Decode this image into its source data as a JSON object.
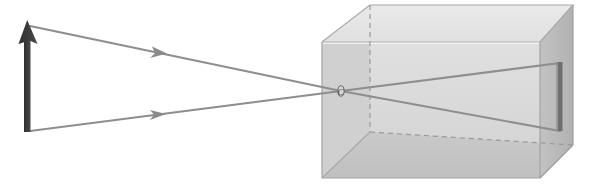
{
  "figure": {
    "width": 594,
    "height": 185,
    "background_color": "#ffffff"
  },
  "labels": {
    "pinhole": "C"
  },
  "colors": {
    "object_arrow": "#3b3b3b",
    "image_arrow": "#6f6f6f",
    "ray": "#8e8e8e",
    "box_front_face": "#d9d9d9",
    "box_top_face": "#e6e6e6",
    "box_right_face": "#b9b9b9",
    "box_bottom_inner_face": "#c4c4c4",
    "box_left_inner_face": "#cfcfcf",
    "box_edge": "#9a9a9a",
    "box_highlight_edge": "#f6f6f6",
    "hidden_edge_dashed": "#9a9a9a",
    "background": "#ffffff"
  },
  "object": {
    "name": "object-arrow",
    "description": "Upright dark arrow representing the object",
    "base_x": 27,
    "base_y": 131,
    "tip_x": 27,
    "tip_y": 22,
    "shaft_width": 6,
    "head_width": 17,
    "head_height": 22
  },
  "pinhole": {
    "name": "pinhole-point",
    "x": 341,
    "y": 91,
    "radius_x": 3.2,
    "radius_y": 5.0,
    "label_offset_x": -0.5,
    "label_offset_y": 3.0
  },
  "rays": [
    {
      "name": "ray-from-object-tip",
      "from_x": 30,
      "from_y": 26,
      "to_x": 341,
      "to_y": 91,
      "arrow_at_x": 160,
      "arrow_at_y": 52,
      "stroke_width": 2.0
    },
    {
      "name": "ray-from-object-base",
      "from_x": 30,
      "from_y": 131,
      "to_x": 341,
      "to_y": 91,
      "arrow_at_x": 158,
      "arrow_at_y": 115,
      "stroke_width": 2.0
    },
    {
      "name": "ray-inside-to-image-bottom",
      "from_x": 341,
      "from_y": 91,
      "to_x": 560,
      "to_y": 63,
      "stroke_width": 2.0
    },
    {
      "name": "ray-inside-to-image-top",
      "from_x": 341,
      "from_y": 91,
      "to_x": 560,
      "to_y": 131,
      "stroke_width": 2.0
    }
  ],
  "box": {
    "name": "camera-box",
    "front_face": {
      "left": 322,
      "right": 540,
      "top": 42,
      "bottom": 178
    },
    "depth_offset_x": 33,
    "depth_offset_y": -37,
    "vertices": {
      "front_top_left": [
        322,
        42
      ],
      "front_top_right": [
        540,
        42
      ],
      "front_bottom_right": [
        540,
        178
      ],
      "front_bottom_left": [
        322,
        178
      ],
      "back_top_left": [
        370,
        5
      ],
      "back_top_right": [
        573,
        5
      ],
      "back_bottom_right": [
        573,
        145
      ],
      "back_bottom_left": [
        370,
        132
      ]
    }
  },
  "projected_image": {
    "name": "projected-image-arrow",
    "description": "Inverted image formed on the far interior wall",
    "x": 560,
    "top_y": 62,
    "bottom_y": 131,
    "width": 4
  },
  "annotations": {
    "has_hidden_dashed_edges": true,
    "hidden_edges": [
      "back-left-vertical",
      "back-bottom-left-to-back-bottom-right"
    ]
  }
}
